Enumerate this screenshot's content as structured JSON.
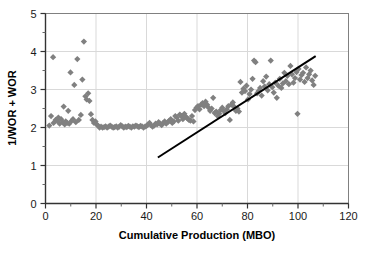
{
  "chart_data": {
    "type": "scatter",
    "title": "",
    "xlabel": "Cumulative Production (MBO)",
    "ylabel": "1/WOR + WOR",
    "xlim": [
      0,
      120
    ],
    "ylim": [
      0,
      5
    ],
    "xticks": [
      0,
      20,
      40,
      60,
      80,
      100,
      120
    ],
    "xtick_labels": [
      "0",
      "20",
      "40",
      "60",
      "80",
      "100",
      "120"
    ],
    "xminor_step": 10,
    "yticks": [
      0,
      1,
      2,
      3,
      4,
      5
    ],
    "ytick_labels": [
      "0",
      "1",
      "2",
      "3",
      "4",
      "5"
    ],
    "yminor_step": 0.5,
    "grid": {
      "x": true,
      "y": true,
      "color": "#d9d9d9"
    },
    "legend": null,
    "marker": {
      "shape": "diamond",
      "color": "#808080",
      "size": 5
    },
    "series": [
      {
        "name": "1/WOR + WOR vs Cumulative Production",
        "marker_color": "#808080",
        "points": [
          [
            1.5,
            2.05
          ],
          [
            2.2,
            2.3
          ],
          [
            3.0,
            3.85
          ],
          [
            3.2,
            2.12
          ],
          [
            4.0,
            2.2
          ],
          [
            4.6,
            2.18
          ],
          [
            5.1,
            2.26
          ],
          [
            5.6,
            2.1
          ],
          [
            6.2,
            2.22
          ],
          [
            6.8,
            2.14
          ],
          [
            7.2,
            2.55
          ],
          [
            7.6,
            2.08
          ],
          [
            8.0,
            2.16
          ],
          [
            8.6,
            2.12
          ],
          [
            9.0,
            2.44
          ],
          [
            9.4,
            2.1
          ],
          [
            9.9,
            3.45
          ],
          [
            10.4,
            2.18
          ],
          [
            10.9,
            2.22
          ],
          [
            11.4,
            3.12
          ],
          [
            12.0,
            2.14
          ],
          [
            12.6,
            3.8
          ],
          [
            13.2,
            2.2
          ],
          [
            14.0,
            2.33
          ],
          [
            14.6,
            3.26
          ],
          [
            15.2,
            4.26
          ],
          [
            15.8,
            2.82
          ],
          [
            16.3,
            2.74
          ],
          [
            16.9,
            2.9
          ],
          [
            17.4,
            2.7
          ],
          [
            18.0,
            2.35
          ],
          [
            18.6,
            2.2
          ],
          [
            19.2,
            2.12
          ],
          [
            19.8,
            2.16
          ],
          [
            20.3,
            2.08
          ],
          [
            20.9,
            2.04
          ],
          [
            21.4,
            2.0
          ],
          [
            22.0,
            2.02
          ],
          [
            22.6,
            2.0
          ],
          [
            23.2,
            2.01
          ],
          [
            23.8,
            2.03
          ],
          [
            24.4,
            2.0
          ],
          [
            25.0,
            2.02
          ],
          [
            25.6,
            2.05
          ],
          [
            26.2,
            2.02
          ],
          [
            26.8,
            2.0
          ],
          [
            27.4,
            2.01
          ],
          [
            28.0,
            2.03
          ],
          [
            28.6,
            2.0
          ],
          [
            29.2,
            2.02
          ],
          [
            29.8,
            2.06
          ],
          [
            30.4,
            2.03
          ],
          [
            31.0,
            2.0
          ],
          [
            31.6,
            2.02
          ],
          [
            32.2,
            2.01
          ],
          [
            32.8,
            2.04
          ],
          [
            33.4,
            2.02
          ],
          [
            34.0,
            2.0
          ],
          [
            34.6,
            2.03
          ],
          [
            35.2,
            2.02
          ],
          [
            35.8,
            2.05
          ],
          [
            36.4,
            2.03
          ],
          [
            37.0,
            2.01
          ],
          [
            37.6,
            2.04
          ],
          [
            38.2,
            2.03
          ],
          [
            38.8,
            2.0
          ],
          [
            39.4,
            2.02
          ],
          [
            40.0,
            2.04
          ],
          [
            40.6,
            2.08
          ],
          [
            41.2,
            2.12
          ],
          [
            41.8,
            2.06
          ],
          [
            42.4,
            2.02
          ],
          [
            43.0,
            2.05
          ],
          [
            43.6,
            2.1
          ],
          [
            44.2,
            2.08
          ],
          [
            44.8,
            2.14
          ],
          [
            45.4,
            2.1
          ],
          [
            46.0,
            2.06
          ],
          [
            46.6,
            2.12
          ],
          [
            47.2,
            2.16
          ],
          [
            47.8,
            2.1
          ],
          [
            48.4,
            2.14
          ],
          [
            49.0,
            2.18
          ],
          [
            49.6,
            2.22
          ],
          [
            50.2,
            2.12
          ],
          [
            50.8,
            2.16
          ],
          [
            51.4,
            2.3
          ],
          [
            52.0,
            2.26
          ],
          [
            52.6,
            2.18
          ],
          [
            53.2,
            2.34
          ],
          [
            53.8,
            2.3
          ],
          [
            54.4,
            2.22
          ],
          [
            55.0,
            2.36
          ],
          [
            55.6,
            2.28
          ],
          [
            56.2,
            2.24
          ],
          [
            56.8,
            2.2
          ],
          [
            57.4,
            2.18
          ],
          [
            58.0,
            2.3
          ],
          [
            58.6,
            2.16
          ],
          [
            59.2,
            2.46
          ],
          [
            59.8,
            2.52
          ],
          [
            60.4,
            2.56
          ],
          [
            61.0,
            2.48
          ],
          [
            61.6,
            2.6
          ],
          [
            62.2,
            2.64
          ],
          [
            62.8,
            2.56
          ],
          [
            63.4,
            2.68
          ],
          [
            64.0,
            2.6
          ],
          [
            64.6,
            2.52
          ],
          [
            65.2,
            2.44
          ],
          [
            65.8,
            2.5
          ],
          [
            66.4,
            2.78
          ],
          [
            67.0,
            2.38
          ],
          [
            67.6,
            2.42
          ],
          [
            68.2,
            2.3
          ],
          [
            68.8,
            2.36
          ],
          [
            69.4,
            2.46
          ],
          [
            70.0,
            2.52
          ],
          [
            70.6,
            2.44
          ],
          [
            71.2,
            2.38
          ],
          [
            71.8,
            2.48
          ],
          [
            72.4,
            2.56
          ],
          [
            73.0,
            2.2
          ],
          [
            73.6,
            2.6
          ],
          [
            74.2,
            2.66
          ],
          [
            74.8,
            2.54
          ],
          [
            75.4,
            2.44
          ],
          [
            76.0,
            2.5
          ],
          [
            76.6,
            2.42
          ],
          [
            77.2,
            3.2
          ],
          [
            77.8,
            2.92
          ],
          [
            78.4,
            3.02
          ],
          [
            79.0,
            2.96
          ],
          [
            79.6,
            3.1
          ],
          [
            80.2,
            2.74
          ],
          [
            80.8,
            2.88
          ],
          [
            81.4,
            3.0
          ],
          [
            82.0,
            3.28
          ],
          [
            82.6,
            3.76
          ],
          [
            83.2,
            3.72
          ],
          [
            83.8,
            2.9
          ],
          [
            84.4,
            2.96
          ],
          [
            85.0,
            3.04
          ],
          [
            85.6,
            2.84
          ],
          [
            86.2,
            3.22
          ],
          [
            86.8,
            3.08
          ],
          [
            87.4,
            3.34
          ],
          [
            88.0,
            2.98
          ],
          [
            88.6,
            3.14
          ],
          [
            89.2,
            3.76
          ],
          [
            89.8,
            3.06
          ],
          [
            90.4,
            2.92
          ],
          [
            91.0,
            3.18
          ],
          [
            91.6,
            2.78
          ],
          [
            92.2,
            3.1
          ],
          [
            92.8,
            3.28
          ],
          [
            93.4,
            3.04
          ],
          [
            94.0,
            3.16
          ],
          [
            94.6,
            3.44
          ],
          [
            95.2,
            3.22
          ],
          [
            95.8,
            3.36
          ],
          [
            96.4,
            3.14
          ],
          [
            97.0,
            3.62
          ],
          [
            97.6,
            3.4
          ],
          [
            98.2,
            3.18
          ],
          [
            98.8,
            3.3
          ],
          [
            99.4,
            3.46
          ],
          [
            99.8,
            2.36
          ],
          [
            100.2,
            3.54
          ],
          [
            100.8,
            3.26
          ],
          [
            101.4,
            3.38
          ],
          [
            102.0,
            3.44
          ],
          [
            102.6,
            3.2
          ],
          [
            103.2,
            3.58
          ],
          [
            103.8,
            3.3
          ],
          [
            104.4,
            3.4
          ],
          [
            105.0,
            3.5
          ],
          [
            105.6,
            3.24
          ],
          [
            106.2,
            3.12
          ],
          [
            106.8,
            3.36
          ]
        ]
      }
    ],
    "trendline": {
      "name": "straight-line-trend",
      "color": "#000000",
      "width": 2,
      "x0": 44.5,
      "y0": 1.21,
      "x1": 107.0,
      "y1": 3.88
    }
  }
}
